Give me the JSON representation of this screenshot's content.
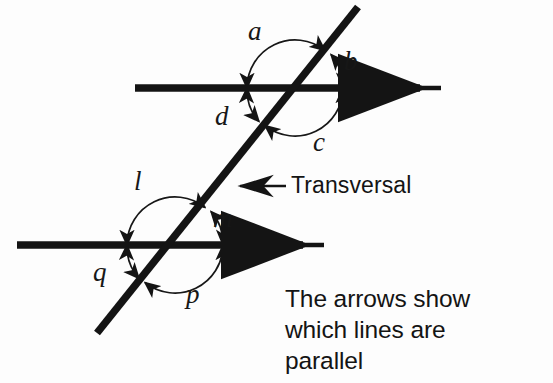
{
  "figure": {
    "ink_color": "#141414",
    "background": "#fdfdfd",
    "angle_labels_upper": [
      {
        "name": "a",
        "text": "a",
        "x": 248,
        "y": 18
      },
      {
        "name": "b",
        "text": "b",
        "x": 344,
        "y": 48
      },
      {
        "name": "c",
        "text": "c",
        "x": 313,
        "y": 129
      },
      {
        "name": "d",
        "text": "d",
        "x": 215,
        "y": 103
      }
    ],
    "angle_labels_lower": [
      {
        "name": "l",
        "text": "l",
        "x": 132,
        "y": 168
      },
      {
        "name": "m",
        "text": "m",
        "x": 213,
        "y": 205
      },
      {
        "name": "p",
        "text": "p",
        "x": 186,
        "y": 281
      },
      {
        "name": "q",
        "text": "q",
        "x": 93,
        "y": 259
      }
    ],
    "transversal_label": "Transversal",
    "caption_lines": [
      "The arrows show",
      "which lines are",
      "parallel"
    ],
    "geometry": {
      "line_top": {
        "x1": 135,
        "y1": 88,
        "x2": 440,
        "y2": 88
      },
      "line_bottom": {
        "x1": 17,
        "y1": 245,
        "x2": 323,
        "y2": 245
      },
      "transversal": {
        "x1": 358,
        "y1": 7,
        "x2": 97,
        "y2": 333
      },
      "intersection_upper": {
        "x": 295,
        "y": 88
      },
      "intersection_lower": {
        "x": 175,
        "y": 245
      },
      "arc_radius_upper": 48,
      "arc_radius_lower": 48
    }
  }
}
